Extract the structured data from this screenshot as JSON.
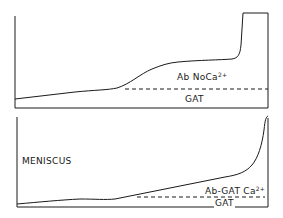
{
  "panels": [
    {
      "id": "top",
      "labels": {
        "species": "Ab NoCa",
        "species_sup": "2+",
        "baseline": "GAT"
      }
    },
    {
      "id": "bottom",
      "labels": {
        "meniscus": "MENISCUS",
        "species": "Ab-GAT Ca",
        "species_sup": "2+",
        "baseline": "GAT"
      }
    }
  ],
  "colors": {
    "ink": "#1a1a1a",
    "background": "#ffffff"
  }
}
